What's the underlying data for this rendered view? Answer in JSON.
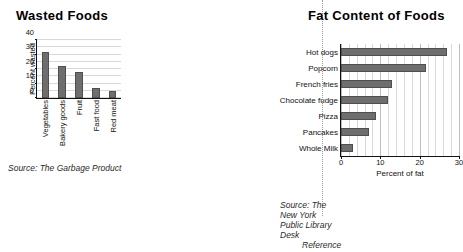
{
  "chart_data": [
    {
      "type": "bar",
      "orientation": "vertical",
      "title": "Wasted Foods",
      "categories": [
        "Vegetables",
        "Bakery goods",
        "Fruit",
        "Fast food",
        "Red meat"
      ],
      "values": [
        32,
        22,
        18,
        7,
        5
      ],
      "xlabel": "",
      "ylabel": "Percent wasted",
      "ylim": [
        0,
        40
      ],
      "yticks": [
        0,
        10,
        20,
        30,
        40
      ],
      "ytick_labels": [
        "0",
        "10",
        "20",
        "30",
        "40"
      ],
      "gridlines": "horizontal",
      "grid": true,
      "legend": false,
      "bar_color": "#6e6e6e",
      "source": "Source: The Garbage Product"
    },
    {
      "type": "bar",
      "orientation": "horizontal",
      "title": "Fat Content of Foods",
      "categories": [
        "Hot dogs",
        "Popcorn",
        "French fries",
        "Chocolate fudge",
        "Pizza",
        "Pancakes",
        "Whole Milk"
      ],
      "values": [
        27,
        21.5,
        13,
        12,
        9,
        7,
        3
      ],
      "xlabel": "Percent of fat",
      "ylabel": "",
      "xlim": [
        0,
        30
      ],
      "xticks": [
        0,
        10,
        20,
        30
      ],
      "xtick_labels": [
        "0",
        "10",
        "20",
        "30"
      ],
      "minor_grid_step": 2,
      "gridlines": "vertical",
      "grid": true,
      "legend": false,
      "bar_color": "#6e6e6e",
      "source_line1": "Source: The New York Public Library Desk",
      "source_line2": "Reference"
    }
  ],
  "page": {
    "left_panel": {
      "title": "Wasted Foods",
      "source": "Source: The Garbage Product"
    },
    "right_panel": {
      "title": "Fat Content of Foods",
      "source_line1": "Source: The New York Public Library Desk",
      "source_line2": "Reference"
    }
  }
}
